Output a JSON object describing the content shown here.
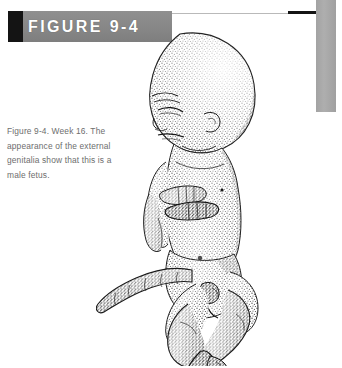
{
  "page": {
    "background_color": "#ffffff",
    "width": 342,
    "height": 368
  },
  "header": {
    "banner_label": "FIGURE 9-4",
    "banner_color": "#8a8a8a",
    "banner_block_color": "#141414",
    "banner_text_color": "#ffffff",
    "rule_color": "#b9b9b9",
    "rule_bold_color": "#141414"
  },
  "edge_bar": {
    "color": "#a8a8a8"
  },
  "caption": {
    "text": "Figure 9-4. Week 16. The appearance of the external genitalia show that this is a male fetus.",
    "text_color": "#6d6d6d"
  },
  "illustration": {
    "title": "stippled anatomical drawing of a 16-week male fetus",
    "subject": "fetus",
    "view": "profile facing left, arms folded across chest, legs crossed, umbilical cord extending to the left",
    "style": "stipple / pointillist pen-and-ink",
    "ink_color": "#1c1c1c"
  }
}
